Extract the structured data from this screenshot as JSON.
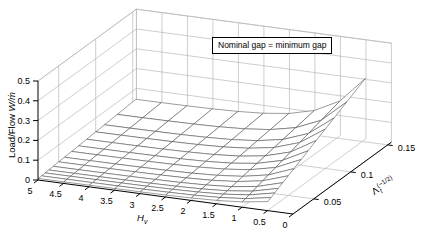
{
  "annotation": {
    "text": "Nominal gap = minimum gap"
  },
  "axes": {
    "z": {
      "label_prefix": "Load/Flow ",
      "label_math": "W/ṁ"
    },
    "x": {
      "label_base": "H",
      "label_sub": "v"
    },
    "y": {
      "label_base": "Λ",
      "label_sub": "t",
      "label_sup": "(−1/2)"
    }
  },
  "colors": {
    "background": "#ffffff",
    "grid": "#b9b9b9",
    "axis": "#000000",
    "mesh_edge": "#4a4a4a",
    "mesh_face": "#ffffff",
    "text": "#000000"
  },
  "chart_data": {
    "type": "surface",
    "title": "",
    "annotation": "Nominal gap = minimum gap",
    "x_axis": {
      "label": "H_v",
      "range": [
        0,
        5
      ],
      "tick_values": [
        5,
        4.5,
        4,
        3.5,
        3,
        2.5,
        2,
        1.5,
        1,
        0.5,
        0
      ]
    },
    "y_axis": {
      "label": "Λ_t^(−1/2)",
      "range": [
        0.022,
        0.155
      ],
      "tick_values": [
        0.05,
        0.1,
        0.15
      ]
    },
    "z_axis": {
      "label": "Load/Flow W/ṁ",
      "range": [
        0,
        0.5
      ],
      "tick_values": [
        0,
        0.1,
        0.2,
        0.3,
        0.4,
        0.5
      ]
    },
    "H_values": [
      5,
      4.5,
      4,
      3.5,
      3,
      2.5,
      2,
      1.5,
      1,
      0.5
    ],
    "lambda_inv_sqrt_values": [
      0.1543,
      0.1291,
      0.1118,
      0.1,
      0.0877,
      0.0767,
      0.0674,
      0.0577,
      0.05,
      0.0426,
      0.0365,
      0.0316,
      0.0267,
      0.0224
    ],
    "z_matrix": [
      [
        0.0468,
        0.0391,
        0.0339,
        0.0303,
        0.0266,
        0.0232,
        0.0204,
        0.0175,
        0.0152,
        0.0129,
        0.0111,
        0.0096,
        0.0081,
        0.0068
      ],
      [
        0.0472,
        0.0395,
        0.0342,
        0.0306,
        0.0269,
        0.0235,
        0.0206,
        0.0177,
        0.0153,
        0.013,
        0.0112,
        0.0097,
        0.0082,
        0.0069
      ],
      [
        0.0482,
        0.0404,
        0.0349,
        0.0313,
        0.0274,
        0.024,
        0.0211,
        0.018,
        0.0156,
        0.0133,
        0.0114,
        0.0099,
        0.0083,
        0.007
      ],
      [
        0.0502,
        0.042,
        0.0364,
        0.0325,
        0.0285,
        0.025,
        0.0219,
        0.0188,
        0.0163,
        0.0139,
        0.0119,
        0.0103,
        0.0087,
        0.0073
      ],
      [
        0.0542,
        0.0453,
        0.0392,
        0.0351,
        0.0308,
        0.0269,
        0.0237,
        0.0203,
        0.0176,
        0.015,
        0.0128,
        0.0111,
        0.0094,
        0.0079
      ],
      [
        0.0621,
        0.052,
        0.045,
        0.0403,
        0.0353,
        0.0309,
        0.0271,
        0.0232,
        0.0201,
        0.0172,
        0.0147,
        0.0127,
        0.0108,
        0.009
      ],
      [
        0.0782,
        0.0654,
        0.0567,
        0.0507,
        0.0444,
        0.0389,
        0.0342,
        0.0292,
        0.0253,
        0.0216,
        0.0185,
        0.016,
        0.0135,
        0.0114
      ],
      [
        0.1105,
        0.0925,
        0.0801,
        0.0716,
        0.0628,
        0.0549,
        0.0483,
        0.0413,
        0.0358,
        0.0305,
        0.0261,
        0.0226,
        0.0191,
        0.016
      ],
      [
        0.1757,
        0.147,
        0.1273,
        0.1138,
        0.0998,
        0.0873,
        0.0767,
        0.0657,
        0.0569,
        0.0485,
        0.0416,
        0.036,
        0.0304,
        0.0255
      ],
      [
        0.3068,
        0.2567,
        0.2223,
        0.1988,
        0.1744,
        0.1525,
        0.134,
        0.1147,
        0.0994,
        0.0847,
        0.0726,
        0.0628,
        0.0531,
        0.0445
      ]
    ]
  }
}
